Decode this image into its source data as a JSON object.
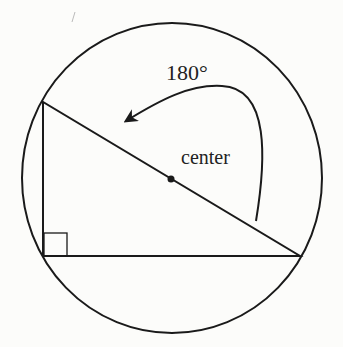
{
  "diagram": {
    "type": "inscribed-right-triangle",
    "labels": {
      "angle": "180°",
      "center": "center"
    },
    "colors": {
      "stroke": "#1a1a1a",
      "background": "#fcfcfa"
    },
    "circle": {
      "cx": 172,
      "cy": 178,
      "r": 150
    },
    "triangle": {
      "vertices": [
        [
          43,
          102
        ],
        [
          43,
          256
        ],
        [
          300,
          256
        ]
      ],
      "right_angle_at": [
        43,
        256
      ]
    },
    "center_point": [
      171,
      179
    ]
  }
}
